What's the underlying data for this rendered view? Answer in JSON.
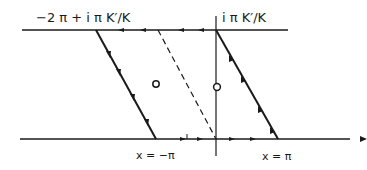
{
  "diagram": {
    "type": "contour-integration-path",
    "labels": {
      "top_left": "−2 π + i π K′/K",
      "top_right": "i π K′/K",
      "bottom_left": "x = −π",
      "bottom_right": "x = π"
    },
    "colors": {
      "ink": "#1a1a1a",
      "background": "#ffffff"
    },
    "elements": {
      "top_line": "horizontal line at Im = π K′/K, arrows pointing left",
      "bottom_line": "real axis, arrows pointing right",
      "vertical_axis": "imaginary axis",
      "left_edge": "slanted solid line from −2π + iπK′/K to x = −π, arrows pointing down",
      "dashed_line": "slanted dashed line parallel to edges",
      "right_edge": "slanted solid line from x = π up to iπK′/K, arrows pointing up",
      "poles": [
        "small circle inside left parallelogram",
        "small circle on imaginary axis"
      ]
    }
  }
}
